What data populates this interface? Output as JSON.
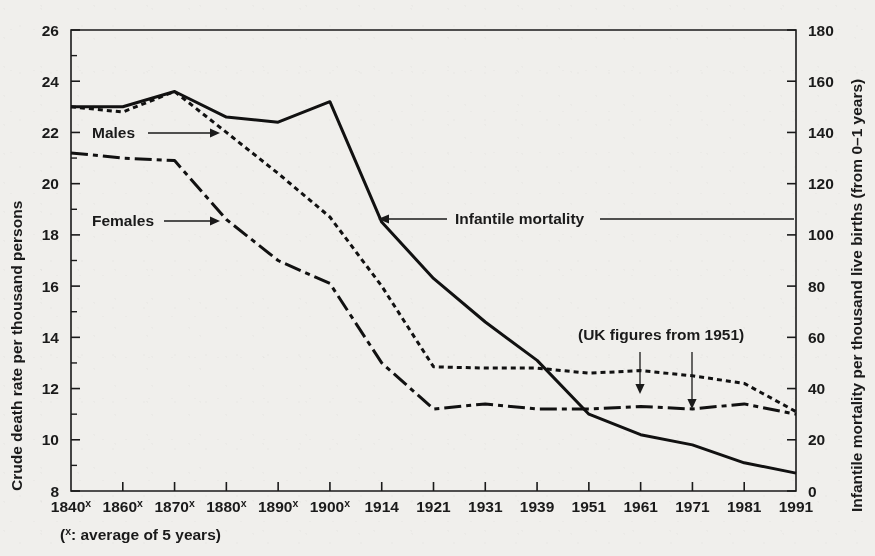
{
  "figure": {
    "background_color": "#f0efec",
    "ink_color": "#1a1a1a"
  },
  "axes": {
    "left_title": "Crude death rate per thousand persons",
    "right_title": "Infantile mortality per thousand live births (from 0–1 years)",
    "left_ticks": [
      "8",
      "10",
      "12",
      "14",
      "16",
      "18",
      "20",
      "22",
      "24",
      "26"
    ],
    "right_ticks": [
      "0",
      "20",
      "40",
      "60",
      "80",
      "100",
      "120",
      "140",
      "160",
      "180"
    ],
    "x_ticks": [
      {
        "label": "1840",
        "sup": "x"
      },
      {
        "label": "1860",
        "sup": "x"
      },
      {
        "label": "1870",
        "sup": "x"
      },
      {
        "label": "1880",
        "sup": "x"
      },
      {
        "label": "1890",
        "sup": "x"
      },
      {
        "label": "1900",
        "sup": "x"
      },
      {
        "label": "1914",
        "sup": ""
      },
      {
        "label": "1921",
        "sup": ""
      },
      {
        "label": "1931",
        "sup": ""
      },
      {
        "label": "1939",
        "sup": ""
      },
      {
        "label": "1951",
        "sup": ""
      },
      {
        "label": "1961",
        "sup": ""
      },
      {
        "label": "1971",
        "sup": ""
      },
      {
        "label": "1981",
        "sup": ""
      },
      {
        "label": "1991",
        "sup": ""
      }
    ]
  },
  "annotations": {
    "males_label": "Males",
    "females_label": "Females",
    "infantile_label": "Infantile mortality",
    "uk_note": "(UK figures from 1951)",
    "footnote": "(",
    "footnote_sup": "x",
    "footnote_rest": ": average of 5 years)"
  },
  "chart_data": {
    "type": "line",
    "title": "",
    "xlabel": "",
    "ylabel": "Crude death rate per thousand persons",
    "y2label": "Infantile mortality per thousand live births (from 0–1 years)",
    "ylim": [
      8,
      26
    ],
    "y2lim": [
      0,
      180
    ],
    "grid": false,
    "legend": "inline-annotations",
    "categories": [
      "1840x",
      "1860x",
      "1870x",
      "1880x",
      "1890x",
      "1900x",
      "1914",
      "1921",
      "1931",
      "1939",
      "1951",
      "1961",
      "1971",
      "1981",
      "1991"
    ],
    "series": [
      {
        "name": "Males",
        "axis": "left",
        "style": "dotted",
        "values": [
          23.0,
          22.8,
          23.6,
          22.0,
          20.4,
          18.7,
          16.0,
          12.85,
          12.8,
          12.8,
          12.6,
          12.7,
          12.5,
          12.2,
          11.1
        ]
      },
      {
        "name": "Females",
        "axis": "left",
        "style": "dash-dot",
        "values": [
          21.2,
          21.0,
          20.9,
          18.6,
          17.0,
          16.1,
          13.0,
          11.2,
          11.4,
          11.2,
          11.2,
          11.3,
          11.2,
          11.4,
          11.0
        ]
      },
      {
        "name": "Infantile mortality",
        "axis": "right",
        "style": "solid",
        "values": [
          150,
          150,
          156,
          146,
          144,
          152,
          105,
          83,
          66,
          51,
          30,
          22,
          18,
          11,
          7
        ]
      }
    ],
    "notes": [
      "(x: average of 5 years)",
      "(UK figures from 1951)"
    ]
  }
}
